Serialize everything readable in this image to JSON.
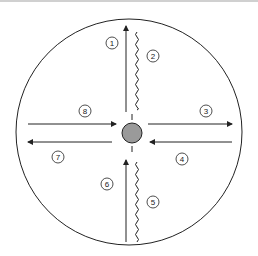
{
  "diagram": {
    "type": "circular flow diagram",
    "circle": {
      "cx": 129,
      "cy": 132,
      "r": 113
    },
    "center_node": {
      "color": "#9a9a9a"
    },
    "colors": {
      "stroke": "#222222",
      "background": "#ffffff",
      "center_fill": "#9a9a9a"
    },
    "labels": [
      {
        "id": "1",
        "text": "1",
        "x": 112,
        "y": 43
      },
      {
        "id": "2",
        "text": "2",
        "x": 153,
        "y": 56
      },
      {
        "id": "3",
        "text": "3",
        "x": 206,
        "y": 111
      },
      {
        "id": "4",
        "text": "4",
        "x": 182,
        "y": 159
      },
      {
        "id": "5",
        "text": "5",
        "x": 153,
        "y": 202
      },
      {
        "id": "6",
        "text": "6",
        "x": 107,
        "y": 184
      },
      {
        "id": "7",
        "text": "7",
        "x": 58,
        "y": 157
      },
      {
        "id": "8",
        "text": "8",
        "x": 85,
        "y": 111
      }
    ],
    "arrows": [
      {
        "id": "arrow-1",
        "direction": "up",
        "from": [
          126,
          112
        ],
        "to": [
          126,
          26
        ]
      },
      {
        "id": "arrow-3",
        "direction": "right",
        "from": [
          148,
          124
        ],
        "to": [
          232,
          124
        ]
      },
      {
        "id": "arrow-4",
        "direction": "left",
        "from": [
          232,
          142
        ],
        "to": [
          150,
          142
        ]
      },
      {
        "id": "arrow-6",
        "direction": "up",
        "from": [
          126,
          242
        ],
        "to": [
          126,
          160
        ]
      },
      {
        "id": "arrow-7",
        "direction": "left",
        "from": [
          112,
          142
        ],
        "to": [
          28,
          142
        ]
      },
      {
        "id": "arrow-8",
        "direction": "right",
        "from": [
          28,
          124
        ],
        "to": [
          116,
          124
        ]
      }
    ],
    "wavy_lines": [
      {
        "id": "wave-2",
        "x": 137,
        "y_start": 32,
        "y_end": 110
      },
      {
        "id": "wave-5",
        "x": 137,
        "y_start": 162,
        "y_end": 242
      }
    ]
  }
}
